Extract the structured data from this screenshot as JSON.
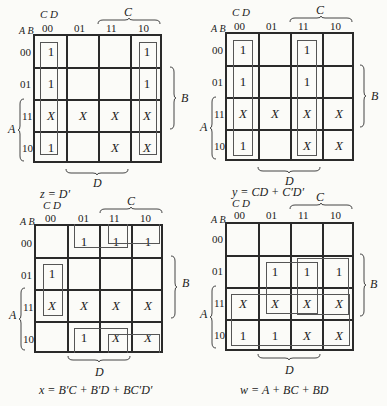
{
  "labels": {
    "cd": "C D",
    "ab": "A B",
    "cols": [
      "00",
      "01",
      "11",
      "10"
    ],
    "rows": [
      "00",
      "01",
      "11",
      "10"
    ],
    "var_a": "A",
    "var_b": "B",
    "var_c": "C",
    "var_d": "D"
  },
  "maps": [
    {
      "id": "z",
      "equation": "z = D′",
      "cells": [
        [
          "1",
          "",
          "",
          "1"
        ],
        [
          "1",
          "",
          "",
          "1"
        ],
        [
          "X",
          "X",
          "X",
          "X"
        ],
        [
          "1",
          "",
          "X",
          "X"
        ]
      ]
    },
    {
      "id": "y",
      "equation": "y = CD + C′D′",
      "cells": [
        [
          "1",
          "",
          "1",
          ""
        ],
        [
          "1",
          "",
          "1",
          ""
        ],
        [
          "X",
          "X",
          "X",
          "X"
        ],
        [
          "1",
          "",
          "X",
          "X"
        ]
      ]
    },
    {
      "id": "x",
      "equation": "x = B′C + B′D + BC′D′",
      "cells": [
        [
          "",
          "1",
          "1",
          "1"
        ],
        [
          "1",
          "",
          "",
          ""
        ],
        [
          "X",
          "X",
          "X",
          "X"
        ],
        [
          "",
          "1",
          "X",
          "X"
        ]
      ]
    },
    {
      "id": "w",
      "equation": "w = A + BC + BD",
      "cells": [
        [
          "",
          "",
          "",
          ""
        ],
        [
          "",
          "1",
          "1",
          "1"
        ],
        [
          "X",
          "X",
          "X",
          "X"
        ],
        [
          "1",
          "1",
          "X",
          "X"
        ]
      ]
    }
  ]
}
